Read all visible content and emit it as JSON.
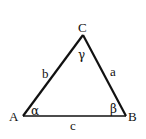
{
  "diagram": {
    "type": "triangle",
    "colors": {
      "stroke": "#111111",
      "text": "#111111",
      "background": "#ffffff"
    },
    "vertices": [
      {
        "label": "A",
        "x": 23,
        "y": 116
      },
      {
        "label": "B",
        "x": 126,
        "y": 116
      },
      {
        "label": "C",
        "x": 83,
        "y": 35
      }
    ],
    "sides": [
      {
        "label": "a",
        "between": "B-C"
      },
      {
        "label": "b",
        "between": "A-C"
      },
      {
        "label": "c",
        "between": "A-B"
      }
    ],
    "angles": [
      {
        "label": "α",
        "at": "A"
      },
      {
        "label": "β",
        "at": "B"
      },
      {
        "label": "γ",
        "at": "C"
      }
    ]
  }
}
